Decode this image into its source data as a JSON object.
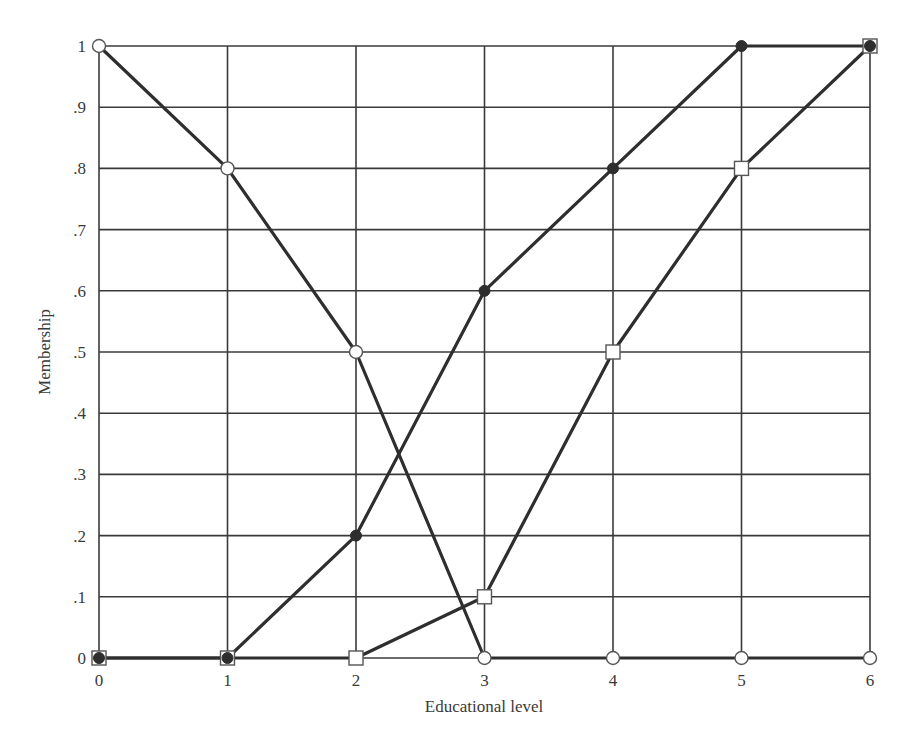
{
  "chart_data": {
    "type": "line",
    "title": "",
    "xlabel": "Educational level",
    "ylabel": "Membership",
    "x": [
      0,
      1,
      2,
      3,
      4,
      5,
      6
    ],
    "xticks": [
      "0",
      "1",
      "2",
      "3",
      "4",
      "5",
      "6"
    ],
    "yticks": [
      "0",
      ".1",
      ".2",
      ".3",
      ".4",
      ".5",
      ".6",
      ".7",
      ".8",
      ".9",
      "1"
    ],
    "xlim": [
      0,
      6
    ],
    "ylim": [
      0,
      1
    ],
    "grid": true,
    "legend": null,
    "series": [
      {
        "name": "open-circle series",
        "marker": "open-circle",
        "values": [
          1.0,
          0.8,
          0.5,
          0.0,
          0.0,
          0.0,
          0.0
        ]
      },
      {
        "name": "filled-circle series",
        "marker": "filled-circle",
        "values": [
          0.0,
          0.0,
          0.2,
          0.6,
          0.8,
          1.0,
          1.0
        ]
      },
      {
        "name": "open-square series",
        "marker": "open-square",
        "values": [
          0.0,
          0.0,
          0.0,
          0.1,
          0.5,
          0.8,
          1.0
        ]
      }
    ]
  },
  "colors": {
    "grid": "#3a3a3a",
    "line": "#2e2e2e",
    "marker_fill_dark": "#2e2e2e",
    "marker_fill_light": "#ffffff"
  }
}
